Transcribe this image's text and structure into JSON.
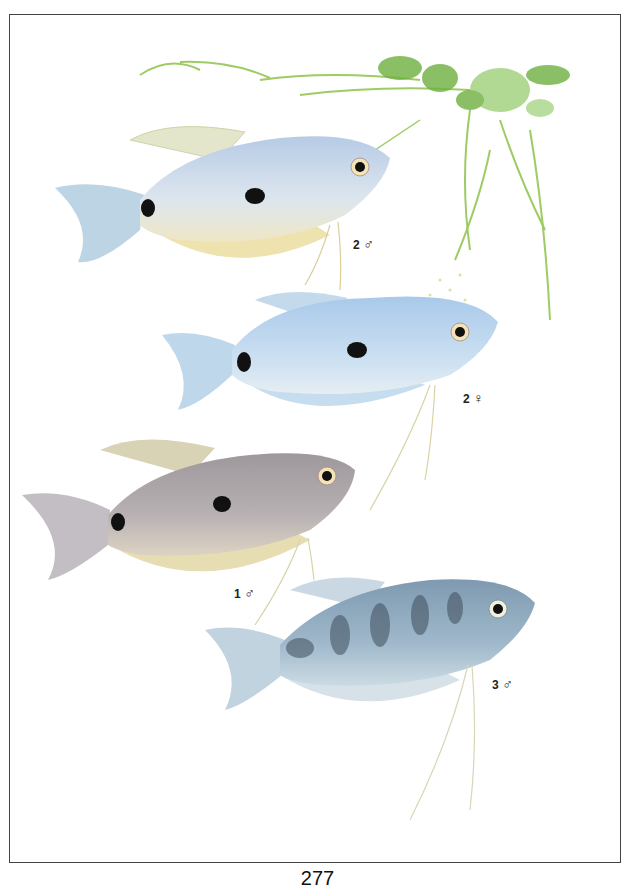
{
  "page": {
    "number": "277",
    "frame_color": "#444444",
    "background": "#ffffff"
  },
  "illustration": {
    "subject": "gourami-fish-plate",
    "plant": {
      "name": "aquatic-plant",
      "color": "#7fbf3f"
    },
    "fish": [
      {
        "id": "fish-2-male",
        "number": "2",
        "sex_symbol": "♂",
        "body_color": "#c9d9ea",
        "fin_color": "#e7e3c0",
        "spots": 2
      },
      {
        "id": "fish-2-female",
        "number": "2",
        "sex_symbol": "♀",
        "body_color": "#bcd7ee",
        "fin_color": "#d6e8f4",
        "spots": 2
      },
      {
        "id": "fish-1-male",
        "number": "1",
        "sex_symbol": "♂",
        "body_color": "#a8a3a6",
        "fin_color": "#e4dcc0",
        "spots": 2
      },
      {
        "id": "fish-3-male",
        "number": "3",
        "sex_symbol": "♂",
        "body_color": "#8fa8bd",
        "fin_color": "#d8e4ea",
        "bands": true
      }
    ]
  }
}
